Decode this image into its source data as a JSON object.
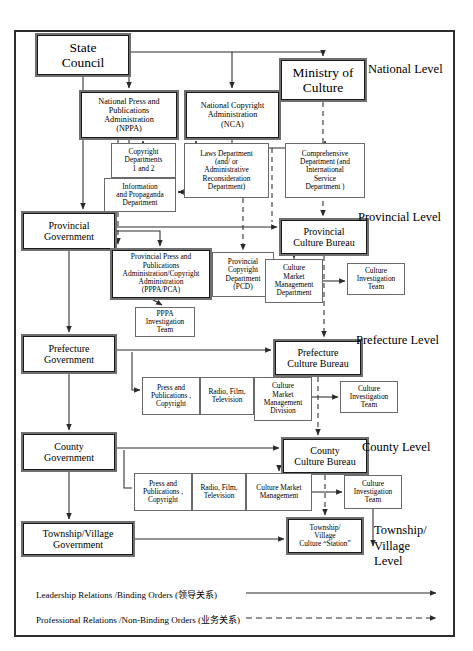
{
  "diagram": {
    "levels": [
      {
        "id": "national",
        "label": "National Level",
        "x": 368,
        "y": 62
      },
      {
        "id": "provincial",
        "label": "Provincial Level",
        "x": 360,
        "y": 210
      },
      {
        "id": "prefecture",
        "label": "Prefecture Level",
        "x": 358,
        "y": 333
      },
      {
        "id": "county",
        "label": "County Level",
        "x": 362,
        "y": 440
      },
      {
        "id": "township",
        "label": "Township/\nVillage\nLevel",
        "x": 375,
        "y": 525
      }
    ],
    "nodes": {
      "state_council": {
        "text": "State\nCouncil",
        "x": 35,
        "y": 33,
        "w": 96,
        "h": 44,
        "style": "heavy",
        "size": "t-lg"
      },
      "nppa": {
        "text": "National Press and\nPublications\nAdministration\n(NPPA)",
        "x": 79,
        "y": 90,
        "w": 100,
        "h": 50,
        "style": "heavy",
        "size": "t-sm"
      },
      "nca": {
        "text": "National Copyright\nAdministration\n(NCA)",
        "x": 184,
        "y": 90,
        "w": 97,
        "h": 50,
        "style": "heavy",
        "size": "t-sm"
      },
      "ministry_culture": {
        "text": "Ministry of\nCulture",
        "x": 279,
        "y": 58,
        "w": 88,
        "h": 44,
        "style": "heavy",
        "size": "t-lg"
      },
      "copyright_depts": {
        "text": "Copyright\nDepartments\n1 and 2",
        "x": 111,
        "y": 143,
        "w": 65,
        "h": 35,
        "style": "thin",
        "size": "t-xs"
      },
      "info_propaganda": {
        "text": "Information\nand Propaganda\nDepartment",
        "x": 104,
        "y": 178,
        "w": 72,
        "h": 34,
        "style": "thin",
        "size": "t-xs"
      },
      "laws_dept": {
        "text": "Laws Department\n(and/ or\nAdministrative\nReconsideration\nDepartment)",
        "x": 184,
        "y": 143,
        "w": 85,
        "h": 55,
        "style": "thin",
        "size": "t-xs"
      },
      "comprehensive_dept": {
        "text": "Comprehensive\nDepartment (and\nInternational\nService\nDepartment )",
        "x": 285,
        "y": 143,
        "w": 80,
        "h": 55,
        "style": "thin",
        "size": "t-xs"
      },
      "provincial_gov": {
        "text": "Provincial\nGovernment",
        "x": 21,
        "y": 211,
        "w": 96,
        "h": 40,
        "style": "heavy",
        "size": "t-md"
      },
      "pppa_pca": {
        "text": "Provincial Press and\nPublications\nAdministration/Copyright\nAdministration\n(PPPA/PCA)",
        "x": 110,
        "y": 248,
        "w": 102,
        "h": 52,
        "style": "heavy",
        "size": "t-xs"
      },
      "pcd": {
        "text": "Provincial\nCopyright\nDepartment\n(PCD)",
        "x": 212,
        "y": 252,
        "w": 62,
        "h": 45,
        "style": "thin",
        "size": "t-xs"
      },
      "pppa_invest": {
        "text": "PPPA\nInvestigation\nTeam",
        "x": 135,
        "y": 307,
        "w": 60,
        "h": 30,
        "style": "thin",
        "size": "t-xs"
      },
      "prov_culture_bureau": {
        "text": "Provincial\nCulture Bureau",
        "x": 279,
        "y": 218,
        "w": 90,
        "h": 38,
        "style": "heavy",
        "size": "t-md"
      },
      "prov_cmmd": {
        "text": "Culture\nMarket\nManagement\nDepartment",
        "x": 265,
        "y": 259,
        "w": 58,
        "h": 44,
        "style": "thin",
        "size": "t-xs"
      },
      "prov_cit": {
        "text": "Culture\nInvestigation\nTeam",
        "x": 347,
        "y": 263,
        "w": 58,
        "h": 32,
        "style": "thin",
        "size": "t-xs"
      },
      "prefecture_gov": {
        "text": "Prefecture\nGovernment",
        "x": 21,
        "y": 334,
        "w": 96,
        "h": 40,
        "style": "heavy",
        "size": "t-md"
      },
      "pref_culture_bureau": {
        "text": "Prefecture\nCulture Bureau",
        "x": 273,
        "y": 339,
        "w": 90,
        "h": 38,
        "style": "heavy",
        "size": "t-md"
      },
      "pref_press": {
        "text": "Press and\nPublications ,\nCopyright",
        "x": 142,
        "y": 377,
        "w": 58,
        "h": 38,
        "style": "thin",
        "size": "t-xs"
      },
      "pref_radio": {
        "text": "Radio, Film,\nTelevision",
        "x": 200,
        "y": 377,
        "w": 54,
        "h": 38,
        "style": "thin",
        "size": "t-xs"
      },
      "pref_cmmd": {
        "text": "Culture\nMarket\nManagement\nDivision",
        "x": 254,
        "y": 377,
        "w": 58,
        "h": 44,
        "style": "thin",
        "size": "t-xs"
      },
      "pref_cit": {
        "text": "Culture\nInvestigation\nTeam",
        "x": 340,
        "y": 381,
        "w": 58,
        "h": 32,
        "style": "thin",
        "size": "t-xs"
      },
      "county_gov": {
        "text": "County\nGovernment",
        "x": 21,
        "y": 432,
        "w": 96,
        "h": 40,
        "style": "heavy",
        "size": "t-md"
      },
      "county_culture_bureau": {
        "text": "County\nCulture Bureau",
        "x": 281,
        "y": 437,
        "w": 88,
        "h": 38,
        "style": "heavy",
        "size": "t-md"
      },
      "cnty_press": {
        "text": "Press and\nPublications ,\nCopyright",
        "x": 134,
        "y": 473,
        "w": 58,
        "h": 38,
        "style": "thin",
        "size": "t-xs"
      },
      "cnty_radio": {
        "text": "Radio, Film,\nTelevision",
        "x": 192,
        "y": 473,
        "w": 54,
        "h": 38,
        "style": "thin",
        "size": "t-xs"
      },
      "cnty_cmm": {
        "text": "Culture Market\nManagement",
        "x": 246,
        "y": 473,
        "w": 66,
        "h": 38,
        "style": "thin",
        "size": "t-xs"
      },
      "cnty_cit": {
        "text": "Culture\nInvestigation\nTeam",
        "x": 344,
        "y": 475,
        "w": 58,
        "h": 34,
        "style": "thin",
        "size": "t-xs"
      },
      "township_gov": {
        "text": "Township/Village\nGovernment",
        "x": 21,
        "y": 521,
        "w": 114,
        "h": 36,
        "style": "heavy",
        "size": "t-md"
      },
      "township_station": {
        "text": "Township/\nVillage\nCulture “Station”",
        "x": 286,
        "y": 517,
        "w": 78,
        "h": 38,
        "style": "heavy",
        "size": "t-xs"
      }
    },
    "legend": [
      {
        "id": "leadership",
        "label": "Leadership Relations /Binding Orders (领导关系)",
        "line": "solid"
      },
      {
        "id": "professional",
        "label": "Professional Relations /Non-Binding Orders (业务关系)",
        "line": "dashed"
      }
    ]
  }
}
